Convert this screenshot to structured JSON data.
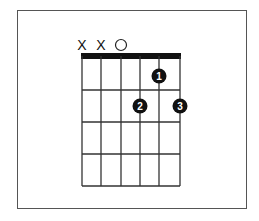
{
  "diagram": {
    "type": "guitar-chord",
    "strings": 6,
    "frets_shown": 4,
    "string_markers": [
      "X",
      "X",
      "O",
      "",
      "",
      ""
    ],
    "fingers": [
      {
        "string": 5,
        "fret": 1,
        "label": "1"
      },
      {
        "string": 4,
        "fret": 2,
        "label": "2"
      },
      {
        "string": 6,
        "fret": 2,
        "label": "3"
      }
    ],
    "colors": {
      "line": "#333333",
      "nut": "#111111",
      "dot": "#111111",
      "dot_text": "#ffffff",
      "frame": "#555555"
    }
  }
}
